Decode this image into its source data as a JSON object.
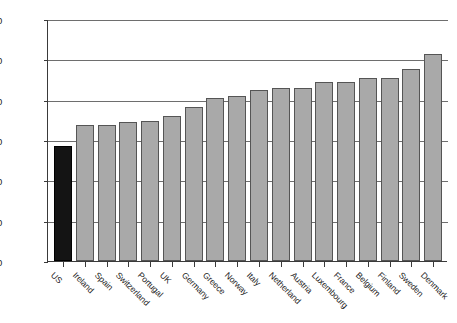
{
  "chart_data": {
    "type": "bar",
    "title": "",
    "subtitle": "",
    "xlabel": "",
    "ylabel": "",
    "ylim": [
      0,
      60
    ],
    "yticks": [
      0,
      10,
      20,
      30,
      40,
      50,
      60
    ],
    "grid": true,
    "legend": "none",
    "categories": [
      "US",
      "Ireland",
      "Spain",
      "Switzerland",
      "Portugal",
      "UK",
      "Germany",
      "Greece",
      "Norway",
      "Italy",
      "Netherland",
      "Austria",
      "Luxembourg",
      "France",
      "Belgium",
      "Finland",
      "Sweden",
      "Denmark"
    ],
    "values": [
      28.5,
      33.8,
      33.7,
      34.5,
      34.7,
      36.0,
      38.1,
      40.5,
      41.0,
      42.5,
      43.0,
      43.0,
      44.3,
      44.3,
      45.3,
      45.3,
      47.5,
      51.2
    ],
    "series": [
      {
        "name": "value",
        "values": [
          28.5,
          33.8,
          33.7,
          34.5,
          34.7,
          36.0,
          38.1,
          40.5,
          41.0,
          42.5,
          43.0,
          43.0,
          44.3,
          44.3,
          45.3,
          45.3,
          47.5,
          51.2
        ]
      }
    ],
    "last_value": 51.4,
    "highlight_index": 0,
    "colors": {
      "bar": "#a9a9a9",
      "bar_highlight": "#141414",
      "bar_edge": "#555555",
      "axis": "#3a3a3a",
      "gridline": "#6e6e6e",
      "background": "#ffffff",
      "text": "#1a1a1a"
    }
  }
}
